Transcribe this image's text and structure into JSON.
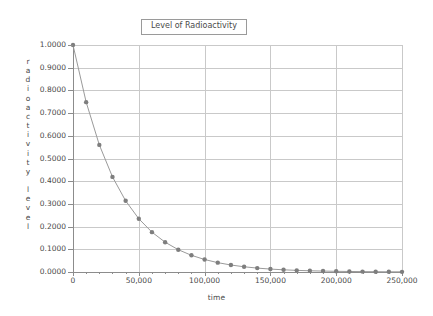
{
  "chart_data": {
    "type": "line",
    "title": "Level of Radioactivity",
    "xlabel": "time",
    "ylabel": "radioactivity level",
    "xlim": [
      0,
      250000
    ],
    "ylim": [
      0,
      1.0
    ],
    "grid": true,
    "legend": "none",
    "marker": "filled-circle",
    "series_color": "#7e7e7e",
    "line_color": "#9a9a9a",
    "grid_color": "#c9c9c9",
    "axis_color": "#8c8c8c",
    "x_tick_labels": [
      "0",
      "50,000",
      "100,000",
      "150,000",
      "200,000",
      "250,000"
    ],
    "x_tick_values": [
      0,
      50000,
      100000,
      150000,
      200000,
      250000
    ],
    "x_minor_tick_interval": 10000,
    "y_tick_labels": [
      "0.0000",
      "0.1000",
      "0.2000",
      "0.3000",
      "0.4000",
      "0.5000",
      "0.6000",
      "0.7000",
      "0.8000",
      "0.9000",
      "1.0000"
    ],
    "y_tick_values": [
      0.0,
      0.1,
      0.2,
      0.3,
      0.4,
      0.5,
      0.6,
      0.7,
      0.8,
      0.9,
      1.0
    ],
    "x": [
      0,
      10000,
      20000,
      30000,
      40000,
      50000,
      60000,
      70000,
      80000,
      90000,
      100000,
      110000,
      120000,
      130000,
      140000,
      150000,
      160000,
      170000,
      180000,
      190000,
      200000,
      210000,
      220000,
      230000,
      240000,
      250000
    ],
    "values": [
      1.0,
      0.7483,
      0.56,
      0.419,
      0.3136,
      0.2346,
      0.1755,
      0.1313,
      0.0983,
      0.0735,
      0.055,
      0.0412,
      0.0308,
      0.023,
      0.0172,
      0.0129,
      0.0097,
      0.0072,
      0.0054,
      0.0041,
      0.003,
      0.0023,
      0.0017,
      0.0013,
      0.0009,
      0.0007
    ]
  },
  "y_axis_title_letters": [
    "r",
    "a",
    "d",
    "i",
    "o",
    "a",
    "c",
    "t",
    "i",
    "v",
    "i",
    "t",
    "y",
    "",
    "l",
    "e",
    "v",
    "e",
    "l"
  ]
}
